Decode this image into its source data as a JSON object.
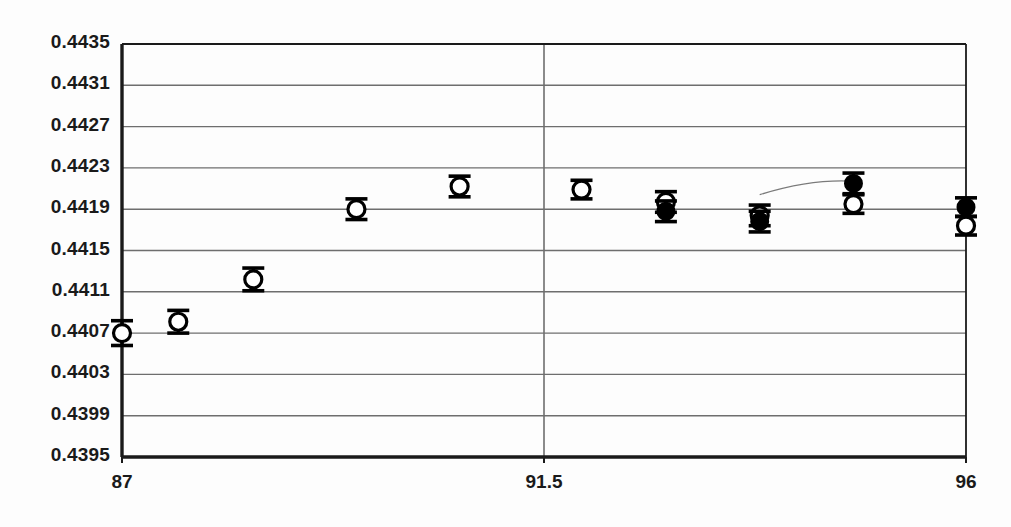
{
  "chart_data": {
    "type": "scatter",
    "title": "",
    "subtitle": "",
    "xlabel": "",
    "ylabel": "",
    "xlim": [
      87,
      96
    ],
    "ylim": [
      0.4395,
      0.4435
    ],
    "grid": true,
    "legend_position": "none",
    "y_ticks": [
      "0.4435",
      "0.4431",
      "0.4427",
      "0.4423",
      "0.4419",
      "0.4415",
      "0.4411",
      "0.4407",
      "0.4403",
      "0.4399",
      "0.4395"
    ],
    "y_tick_values": [
      0.4435,
      0.4431,
      0.4427,
      0.4423,
      0.4419,
      0.4415,
      0.4411,
      0.4407,
      0.4403,
      0.4399,
      0.4395
    ],
    "x_ticks": [
      "87",
      "91.5",
      "96"
    ],
    "x_tick_values": [
      87,
      91.5,
      96
    ],
    "reference_lines": [
      {
        "name": "vertical-reference-91-5",
        "orientation": "vertical",
        "x": 91.5
      }
    ],
    "annotations": [
      {
        "name": "leader-curve",
        "type": "curve",
        "x_start": 93.8,
        "y_start": 0.44204,
        "x_end": 94.8,
        "y_end": 0.44217
      }
    ],
    "series": [
      {
        "name": "open-circles",
        "marker": "open-circle",
        "color": "#000000",
        "points": [
          {
            "x": 87.0,
            "y": 0.4407,
            "yerr": 0.00012
          },
          {
            "x": 87.6,
            "y": 0.44081,
            "yerr": 0.00011
          },
          {
            "x": 88.4,
            "y": 0.44122,
            "yerr": 0.00011
          },
          {
            "x": 89.5,
            "y": 0.4419,
            "yerr": 0.0001
          },
          {
            "x": 90.6,
            "y": 0.44212,
            "yerr": 0.0001
          },
          {
            "x": 91.9,
            "y": 0.44209,
            "yerr": 9e-05
          },
          {
            "x": 92.8,
            "y": 0.44197,
            "yerr": 0.0001
          },
          {
            "x": 93.8,
            "y": 0.44184,
            "yerr": 0.0001
          },
          {
            "x": 94.8,
            "y": 0.44195,
            "yerr": 9e-05
          },
          {
            "x": 96.0,
            "y": 0.44174,
            "yerr": 9e-05
          }
        ]
      },
      {
        "name": "filled-circles",
        "marker": "filled-circle",
        "color": "#000000",
        "points": [
          {
            "x": 92.8,
            "y": 0.44188,
            "yerr": 0.0001
          },
          {
            "x": 93.8,
            "y": 0.44178,
            "yerr": 0.0001
          },
          {
            "x": 94.8,
            "y": 0.44215,
            "yerr": 0.0001
          },
          {
            "x": 96.0,
            "y": 0.44192,
            "yerr": 9e-05
          }
        ]
      }
    ]
  },
  "axes": {
    "y_labels": [
      {
        "text": "0.4435"
      },
      {
        "text": "0.4431"
      },
      {
        "text": "0.4427"
      },
      {
        "text": "0.4423"
      },
      {
        "text": "0.4419"
      },
      {
        "text": "0.4415"
      },
      {
        "text": "0.4411"
      },
      {
        "text": "0.4407"
      },
      {
        "text": "0.4403"
      },
      {
        "text": "0.4399"
      },
      {
        "text": "0.4395"
      }
    ],
    "x_labels": [
      {
        "text": "87"
      },
      {
        "text": "91.5"
      },
      {
        "text": "96"
      }
    ]
  },
  "colors": {
    "axis": "#1a1a1a",
    "grid": "#6e6e6e",
    "marker": "#000000",
    "background": "#fdfdfd",
    "annotation": "#7a7a7a"
  }
}
